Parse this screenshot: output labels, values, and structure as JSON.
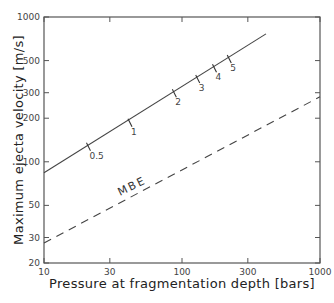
{
  "chart_data": {
    "type": "line",
    "title": "",
    "xlabel": "Pressure at fragmentation depth [bars]",
    "ylabel": "Maximum ejecta velocity [m/s]",
    "xscale": "log",
    "yscale": "log",
    "xlim": [
      10,
      1000
    ],
    "ylim": [
      20,
      1000
    ],
    "xticks": [
      10,
      30,
      100,
      300,
      1000
    ],
    "xtick_labels": [
      "10",
      "30",
      "100",
      "300",
      "1000"
    ],
    "yticks": [
      20,
      30,
      50,
      100,
      200,
      300,
      500,
      1000
    ],
    "ytick_labels": [
      "20",
      "30",
      "50",
      "100",
      "200",
      "300",
      "500",
      "1000"
    ],
    "grid": false,
    "series": [
      {
        "name": "solid",
        "style": "solid",
        "x": [
          10,
          406
        ],
        "y": [
          84,
          764
        ],
        "markers": [
          {
            "label": "0.5",
            "x": 21,
            "y": 127
          },
          {
            "label": "1",
            "x": 42,
            "y": 186
          },
          {
            "label": "2",
            "x": 88,
            "y": 298
          },
          {
            "label": "3",
            "x": 130,
            "y": 373
          },
          {
            "label": "4",
            "x": 172,
            "y": 443
          },
          {
            "label": "5",
            "x": 220,
            "y": 512
          }
        ]
      },
      {
        "name": "MBE",
        "style": "dashed",
        "x": [
          10,
          1000
        ],
        "y": [
          27.5,
          281
        ]
      }
    ],
    "annotations": [
      {
        "text": "MBE",
        "near_series": "MBE"
      }
    ]
  }
}
